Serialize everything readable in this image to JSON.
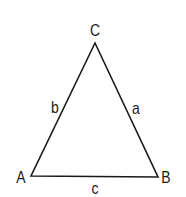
{
  "diagram": {
    "type": "triangle",
    "stroke_color": "#1a1a1a",
    "vertices": [
      {
        "id": "A",
        "label": "A"
      },
      {
        "id": "B",
        "label": "B"
      },
      {
        "id": "C",
        "label": "C"
      }
    ],
    "sides": [
      {
        "id": "a",
        "label": "a",
        "between": [
          "B",
          "C"
        ]
      },
      {
        "id": "b",
        "label": "b",
        "between": [
          "A",
          "C"
        ]
      },
      {
        "id": "c",
        "label": "c",
        "between": [
          "A",
          "B"
        ]
      }
    ]
  }
}
